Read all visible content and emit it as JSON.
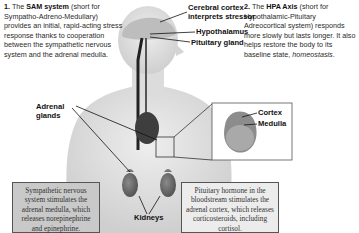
{
  "notes": {
    "sam": {
      "number": "1.",
      "prefix": "The ",
      "bold": "SAM system",
      "text": " (short for Sympatho-Adreno-Medullary) provides an initial, rapid-acting stress response thanks to cooperation between the sympathetic nervous system and the adrenal medulla."
    },
    "hpa": {
      "number": "2.",
      "prefix": "The ",
      "bold": "HPA Axis",
      "text": " (short for Hypothalamic-Pituitary Adreocortical system) responds more slowly but lasts longer. It also helps restore the body to its baseline state, ",
      "italic": "homeostasis",
      "suffix": "."
    }
  },
  "labels": {
    "cerebral_cortex_line1": "Cerebral cortex",
    "cerebral_cortex_line2": "interprets stressor",
    "hypothalamus": "Hypothalamus",
    "pituitary": "Pituitary gland",
    "adrenal_line1": "Adrenal",
    "adrenal_line2": "glands",
    "kidneys": "Kidneys",
    "cortex": "Cortex",
    "medulla": "Medulla"
  },
  "boxes": {
    "sam_box": "Sympathetic nervous system stimulates the adrenal medulla, which releases norepinephrine and epinephrine.",
    "hpa_box": "Pituitary hormone in the bloodstream stimulates the adrenal cortex, which releases corticosteroids, including cortisol."
  },
  "colors": {
    "sam_box_bg": "#c9c9c9",
    "hpa_box_bg": "#ececec",
    "body": "#d9d9d9",
    "organ": "#4a4a4a"
  }
}
